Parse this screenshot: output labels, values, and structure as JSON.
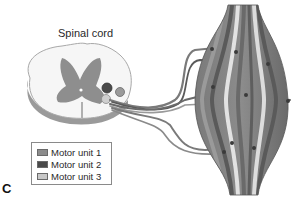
{
  "diagram": {
    "title": "Spinal cord",
    "panel_letter": "C",
    "legend": {
      "items": [
        {
          "label": "Motor unit 1",
          "color": "#8c8c8c"
        },
        {
          "label": "Motor unit 2",
          "color": "#4a4a4a"
        },
        {
          "label": "Motor unit 3",
          "color": "#c8c8c8"
        }
      ]
    },
    "colors": {
      "gray_matter": "#8e8e8e",
      "white_matter": "#f4f4f4",
      "cord_edge": "#b8b8b8",
      "muscle_dark": "#6e6e6e",
      "muscle_mid": "#9a9a9a",
      "muscle_light": "#d8d8d8",
      "nerve": "#7a7a7a"
    }
  }
}
